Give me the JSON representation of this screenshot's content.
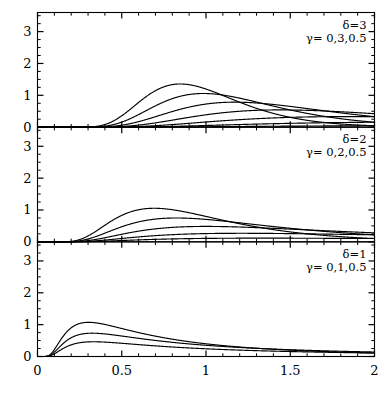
{
  "chart_data": {
    "type": "line",
    "title": "",
    "subtitle": "",
    "xlabel": "",
    "ylabel": "",
    "xlim": [
      0,
      2
    ],
    "ylim": [
      0,
      3.6
    ],
    "grid": false,
    "legend_position": "none",
    "x_ticks_major": [
      0,
      0.5,
      1,
      1.5,
      2
    ],
    "x_tick_labels": [
      "0",
      "0.5",
      "1",
      "1.5",
      "2"
    ],
    "x_ticks_minor_step": 0.1,
    "y_ticks_major": [
      0,
      1,
      2,
      3
    ],
    "y_tick_labels": [
      "0",
      "1",
      "2",
      "3"
    ],
    "y_ticks_minor_step": 0.25,
    "curve_family": "inverse-gaussian-density",
    "panels": [
      {
        "id": "panel-top",
        "delta": 3,
        "delta_label": "δ=3",
        "gamma_label": "γ= 0,3,0.5",
        "gamma_values": [
          0,
          0.5,
          1,
          1.5,
          2,
          2.5,
          3
        ],
        "peak_max": 3.4,
        "peak_x_first": 0.3
      },
      {
        "id": "panel-middle",
        "delta": 2,
        "delta_label": "δ=2",
        "gamma_label": "γ= 0,2,0.5",
        "gamma_values": [
          0,
          0.5,
          1,
          1.5,
          2
        ],
        "peak_max": 2.5,
        "peak_x_first": 0.31
      },
      {
        "id": "panel-bottom",
        "delta": 1,
        "delta_label": "δ=1",
        "gamma_label": "γ= 0,1,0.5",
        "gamma_values": [
          0,
          0.5,
          1
        ],
        "peak_max": 1.6,
        "peak_x_first": 0.17
      }
    ]
  },
  "figure": {
    "panel_count": 3,
    "axis_color": "#000000",
    "curve_color": "#000000",
    "background": "#ffffff"
  }
}
